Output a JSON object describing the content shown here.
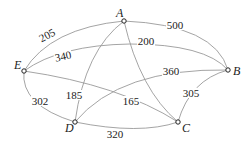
{
  "graph": {
    "nodes": [
      {
        "id": "A",
        "label": "A"
      },
      {
        "id": "B",
        "label": "B"
      },
      {
        "id": "C",
        "label": "C"
      },
      {
        "id": "D",
        "label": "D"
      },
      {
        "id": "E",
        "label": "E"
      }
    ],
    "edges": [
      {
        "from": "A",
        "to": "E",
        "weight": "205"
      },
      {
        "from": "A",
        "to": "B",
        "weight": "500"
      },
      {
        "from": "E",
        "to": "B",
        "weight": "340"
      },
      {
        "from": "A",
        "to": "C",
        "weight": "200"
      },
      {
        "from": "A",
        "to": "D",
        "weight": "185"
      },
      {
        "from": "D",
        "to": "B",
        "weight": "360"
      },
      {
        "from": "E",
        "to": "C",
        "weight": "165"
      },
      {
        "from": "E",
        "to": "D",
        "weight": "302"
      },
      {
        "from": "D",
        "to": "C",
        "weight": "320"
      },
      {
        "from": "C",
        "to": "B",
        "weight": "305"
      }
    ]
  }
}
